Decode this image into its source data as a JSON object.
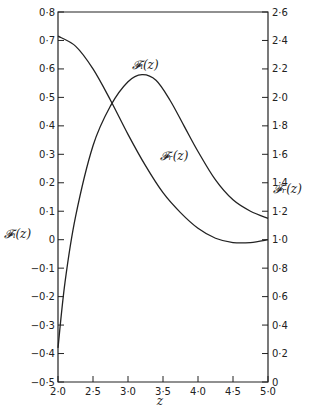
{
  "chart_data": {
    "type": "line",
    "title": "",
    "xlabel": "z",
    "ylabel_left": "𝓕ᵢ(z)",
    "ylabel_right": "𝓕ᵣ(z)",
    "xlim": [
      2.0,
      5.0
    ],
    "ylim_left": [
      -0.5,
      0.8
    ],
    "ylim_right": [
      0,
      2.6
    ],
    "grid": false,
    "x_ticks": [
      "2·0",
      "2·5",
      "3·0",
      "3·5",
      "4·0",
      "4·5",
      "5·0"
    ],
    "x_tick_values": [
      2.0,
      2.5,
      3.0,
      3.5,
      4.0,
      4.5,
      5.0
    ],
    "y_left_ticks": [
      "0·8",
      "0·7",
      "0·6",
      "0·5",
      "0·4",
      "0·3",
      "0·2",
      "0·1",
      "0",
      "−0·1",
      "−0·2",
      "−0·3",
      "−0·4",
      "−0·5"
    ],
    "y_left_tick_values": [
      0.8,
      0.7,
      0.6,
      0.5,
      0.4,
      0.3,
      0.2,
      0.1,
      0,
      -0.1,
      -0.2,
      -0.3,
      -0.4,
      -0.5
    ],
    "y_right_ticks": [
      "2·6",
      "2·4",
      "2·2",
      "2·0",
      "1·8",
      "1·6",
      "1·4",
      "1·2",
      "1·0",
      "0·8",
      "0·6",
      "0·4",
      "0·2",
      "0"
    ],
    "y_right_tick_values": [
      2.6,
      2.4,
      2.2,
      2.0,
      1.8,
      1.6,
      1.4,
      1.2,
      1.0,
      0.8,
      0.6,
      0.4,
      0.2,
      0
    ],
    "series": [
      {
        "name": "𝓕ᵢ(z)",
        "axis": "left",
        "label_pos": {
          "z": 3.05,
          "v": 0.6
        },
        "x": [
          2.0,
          2.1,
          2.25,
          2.5,
          2.75,
          3.0,
          3.2,
          3.4,
          3.6,
          3.8,
          4.0,
          4.25,
          4.5,
          4.75,
          5.0
        ],
        "values": [
          -0.38,
          -0.15,
          0.08,
          0.33,
          0.47,
          0.555,
          0.58,
          0.56,
          0.49,
          0.4,
          0.31,
          0.21,
          0.14,
          0.1,
          0.075
        ]
      },
      {
        "name": "𝓕ᵣ(z)",
        "axis": "right",
        "label_pos": {
          "z": 3.45,
          "v": 1.56
        },
        "x": [
          2.0,
          2.25,
          2.5,
          2.75,
          3.0,
          3.25,
          3.5,
          3.75,
          4.0,
          4.25,
          4.5,
          4.75,
          5.0
        ],
        "values": [
          2.43,
          2.36,
          2.2,
          1.98,
          1.74,
          1.52,
          1.33,
          1.19,
          1.08,
          1.01,
          0.98,
          0.98,
          1.0
        ]
      }
    ],
    "legend": "inline curve labels"
  }
}
